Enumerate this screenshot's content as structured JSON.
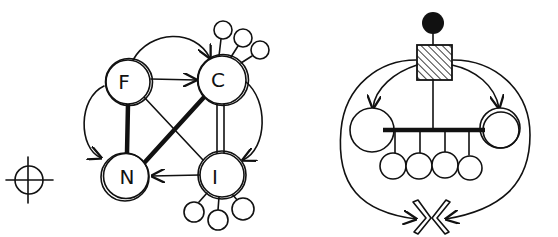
{
  "diagram": {
    "style": "hand-drawn sketch",
    "ink_color": "#111111",
    "background": "#ffffff",
    "left": {
      "crosshair": {
        "cx": 29,
        "cy": 180,
        "r": 14
      },
      "nodes": [
        {
          "id": "F",
          "label": "F",
          "cx": 128,
          "cy": 82,
          "r": 22
        },
        {
          "id": "C",
          "label": "C",
          "cx": 222,
          "cy": 80,
          "r": 24
        },
        {
          "id": "N",
          "label": "N",
          "cx": 125,
          "cy": 177,
          "r": 24
        },
        {
          "id": "I",
          "label": "I",
          "cx": 222,
          "cy": 175,
          "r": 22
        }
      ],
      "edges": [
        {
          "from": "F",
          "to": "C",
          "type": "arrow"
        },
        {
          "from": "F",
          "to": "C",
          "type": "curved-arrow-over-top"
        },
        {
          "from": "F",
          "to": "N",
          "type": "thick-line"
        },
        {
          "from": "C",
          "to": "N",
          "type": "thick-line"
        },
        {
          "from": "F",
          "to": "I",
          "type": "line"
        },
        {
          "from": "C",
          "to": "I",
          "type": "double-line"
        },
        {
          "from": "I",
          "to": "N",
          "type": "arrow"
        },
        {
          "from": "F",
          "to": "N",
          "type": "curved-arrow-left"
        },
        {
          "from": "C",
          "to": "I",
          "type": "curved-arrow-right"
        }
      ],
      "satellites": [
        {
          "attached_to": "C",
          "count": 3
        },
        {
          "attached_to": "I",
          "count": 3
        }
      ]
    },
    "right": {
      "top_dot": {
        "cx": 433,
        "cy": 23,
        "r": 11,
        "filled": true
      },
      "hatched_box": {
        "x": 417,
        "y": 45,
        "w": 35,
        "h": 35
      },
      "side_nodes": [
        {
          "id": "left",
          "cx": 372,
          "cy": 130,
          "r": 22
        },
        {
          "id": "right",
          "cx": 500,
          "cy": 128,
          "r": 20,
          "double": true
        }
      ],
      "bar": {
        "x1": 383,
        "x2": 482,
        "y": 130
      },
      "hanging_nodes": 4,
      "converging_arrows": {
        "cx": 425,
        "cy": 218
      }
    }
  }
}
